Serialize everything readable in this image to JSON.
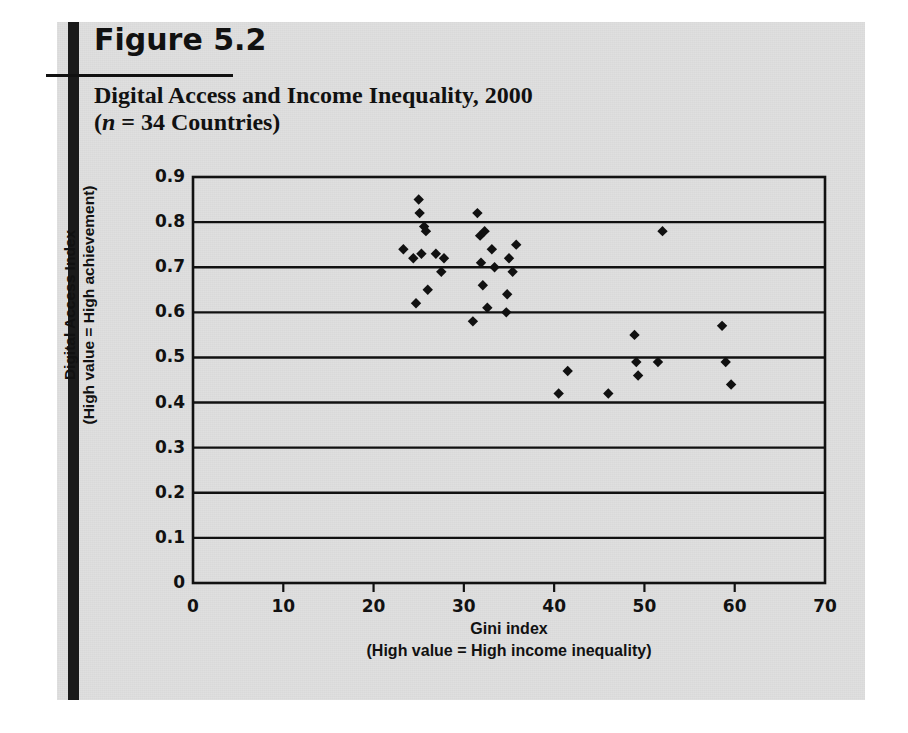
{
  "figure": {
    "number": "Figure 5.2",
    "title_line1": "Digital Access and Income Inequality, 2000",
    "title_line2_open": "(",
    "title_line2_italic": "n",
    "title_line2_rest": " = 34 Countries)"
  },
  "chart_data": {
    "type": "scatter",
    "title": "Digital Access and Income Inequality, 2000 (n = 34 Countries)",
    "xlabel": "Gini index",
    "xlabel_sub": "(High value = High income inequality)",
    "ylabel": "Digital Access Index",
    "ylabel_sub": "(High value = High achievement)",
    "xlim": [
      0,
      70
    ],
    "ylim": [
      0,
      0.9
    ],
    "xticks": [
      "0",
      "10",
      "20",
      "30",
      "40",
      "50",
      "60",
      "70"
    ],
    "yticks": [
      "0",
      "0.1",
      "0.2",
      "0.3",
      "0.4",
      "0.5",
      "0.6",
      "0.7",
      "0.8",
      "0.9"
    ],
    "grid": "horizontal",
    "legend": "none",
    "n": 34,
    "marker": "diamond",
    "marker_color": "#111111",
    "points": [
      {
        "x": 23.3,
        "y": 0.74
      },
      {
        "x": 24.4,
        "y": 0.72
      },
      {
        "x": 24.7,
        "y": 0.62
      },
      {
        "x": 25.0,
        "y": 0.85
      },
      {
        "x": 25.1,
        "y": 0.82
      },
      {
        "x": 25.3,
        "y": 0.73
      },
      {
        "x": 25.6,
        "y": 0.79
      },
      {
        "x": 25.8,
        "y": 0.78
      },
      {
        "x": 26.0,
        "y": 0.65
      },
      {
        "x": 26.9,
        "y": 0.73
      },
      {
        "x": 27.5,
        "y": 0.69
      },
      {
        "x": 27.8,
        "y": 0.72
      },
      {
        "x": 31.0,
        "y": 0.58
      },
      {
        "x": 31.5,
        "y": 0.82
      },
      {
        "x": 31.8,
        "y": 0.77
      },
      {
        "x": 31.9,
        "y": 0.71
      },
      {
        "x": 32.1,
        "y": 0.66
      },
      {
        "x": 32.3,
        "y": 0.78
      },
      {
        "x": 32.6,
        "y": 0.61
      },
      {
        "x": 33.1,
        "y": 0.74
      },
      {
        "x": 33.4,
        "y": 0.7
      },
      {
        "x": 34.7,
        "y": 0.6
      },
      {
        "x": 34.8,
        "y": 0.64
      },
      {
        "x": 35.0,
        "y": 0.72
      },
      {
        "x": 35.4,
        "y": 0.69
      },
      {
        "x": 35.8,
        "y": 0.75
      },
      {
        "x": 40.5,
        "y": 0.42
      },
      {
        "x": 41.5,
        "y": 0.47
      },
      {
        "x": 46.0,
        "y": 0.42
      },
      {
        "x": 48.9,
        "y": 0.55
      },
      {
        "x": 49.1,
        "y": 0.49
      },
      {
        "x": 49.3,
        "y": 0.46
      },
      {
        "x": 51.5,
        "y": 0.49
      },
      {
        "x": 52.0,
        "y": 0.78
      },
      {
        "x": 58.6,
        "y": 0.57
      },
      {
        "x": 59.0,
        "y": 0.49
      },
      {
        "x": 59.6,
        "y": 0.44
      }
    ]
  },
  "geometry": {
    "plot_left": 193,
    "plot_right": 825,
    "plot_top": 177,
    "plot_bottom": 583
  }
}
